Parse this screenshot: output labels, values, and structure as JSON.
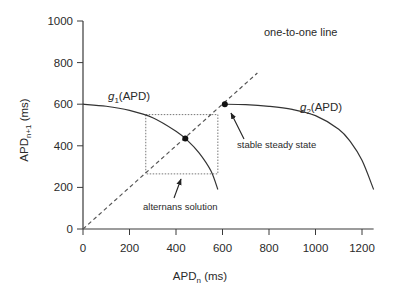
{
  "chart_data": {
    "type": "line",
    "title": "",
    "xlabel": "APD_n (ms)",
    "ylabel": "APD_n+1 (ms)",
    "xlabel_parts": {
      "base": "APD",
      "sub": "n",
      "unit": " (ms)"
    },
    "ylabel_parts": {
      "base": "APD",
      "sub": "n+1",
      "unit": " (ms)"
    },
    "xlim": [
      0,
      1250
    ],
    "ylim": [
      0,
      1000
    ],
    "xticks": [
      0,
      200,
      400,
      600,
      800,
      1000,
      1200
    ],
    "yticks": [
      0,
      200,
      400,
      600,
      800,
      1000
    ],
    "grid": false,
    "series": [
      {
        "name": "g1(APD)",
        "label_base": "g",
        "label_sub": "1",
        "label_rest": "(APD)",
        "style": "solid",
        "x": [
          0,
          100,
          200,
          300,
          400,
          450,
          500,
          550,
          580
        ],
        "y": [
          600,
          590,
          570,
          535,
          470,
          425,
          365,
          280,
          190
        ]
      },
      {
        "name": "g2(APD)",
        "label_base": "g",
        "label_sub": "2",
        "label_rest": "(APD)",
        "style": "solid",
        "x": [
          600,
          700,
          800,
          900,
          1000,
          1100,
          1150,
          1200,
          1250
        ],
        "y": [
          600,
          598,
          590,
          575,
          545,
          480,
          420,
          330,
          190
        ]
      },
      {
        "name": "one-to-one line",
        "style": "dashed",
        "x": [
          0,
          750
        ],
        "y": [
          0,
          750
        ]
      }
    ],
    "alternans_box": {
      "x": [
        270,
        580
      ],
      "y": [
        265,
        550
      ],
      "style": "dotted"
    },
    "points": [
      {
        "name": "stable steady state",
        "x": 610,
        "y": 600
      },
      {
        "name": "alternans fixed point",
        "x": 440,
        "y": 435
      }
    ],
    "annotations": [
      {
        "text": "one-to-one line",
        "x": 790,
        "y": 840
      },
      {
        "text": "stable steady state",
        "x": 690,
        "y": 540,
        "arrow_to": [
          610,
          600
        ]
      },
      {
        "text": "alternans solution",
        "x": 220,
        "y": 180,
        "arrow_to": [
          450,
          265
        ]
      }
    ]
  }
}
